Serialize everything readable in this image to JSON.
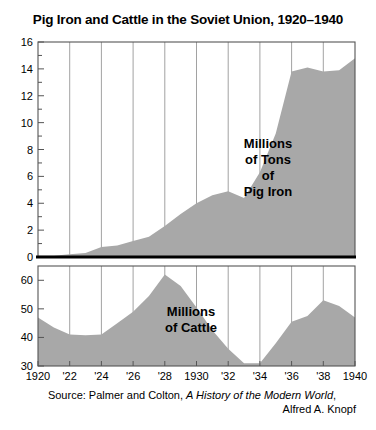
{
  "title": "Pig Iron and Cattle in the Soviet Union, 1920–1940",
  "source": {
    "line1_prefix": "Source: Palmer and Colton, ",
    "line1_italic": "A History of the Modern World",
    "line1_suffix": ",",
    "line2": "Alfred A. Knopf"
  },
  "labels": {
    "pig_iron": [
      "Millions",
      "of Tons",
      "of",
      "Pig Iron"
    ],
    "cattle": [
      "Millions",
      "of Cattle"
    ]
  },
  "colors": {
    "area_fill": "#a8a8a8",
    "axis": "#555555",
    "gridline": "#7a7a7a",
    "zero_line": "#000000",
    "background": "#ffffff",
    "text": "#000000"
  },
  "chart_data": [
    {
      "type": "area",
      "title": "Millions of Tons of Pig Iron",
      "panel": "top",
      "xlabel": "",
      "ylabel": "Millions of Tons of Pig Iron",
      "xlim": [
        1920,
        1940
      ],
      "ylim": [
        0,
        16
      ],
      "yticks": [
        0,
        2,
        4,
        6,
        8,
        10,
        12,
        14,
        16
      ],
      "ytick_labels": [
        "0",
        "2",
        "4",
        "6",
        "8",
        "10",
        "12",
        "14",
        "16"
      ],
      "xticks": [
        1920,
        1922,
        1924,
        1926,
        1928,
        1930,
        1932,
        1934,
        1936,
        1938,
        1940
      ],
      "xtick_labels": [
        "1920",
        "'22",
        "'24",
        "'26",
        "'28",
        "1930",
        "'32",
        "'34",
        "'36",
        "'38",
        "1940"
      ],
      "gridlines": [
        1922,
        1924,
        1926,
        1928,
        1930,
        1932,
        1934,
        1936,
        1938
      ],
      "grid": true,
      "legend": "none",
      "x": [
        1920,
        1921,
        1922,
        1923,
        1924,
        1925,
        1926,
        1927,
        1928,
        1929,
        1930,
        1931,
        1932,
        1933,
        1934,
        1935,
        1936,
        1937,
        1938,
        1939,
        1940
      ],
      "values": [
        0.1,
        0.1,
        0.2,
        0.3,
        0.75,
        0.85,
        1.2,
        1.5,
        2.3,
        3.2,
        4.0,
        4.6,
        4.9,
        4.4,
        6.3,
        9.2,
        13.8,
        14.1,
        13.8,
        13.9,
        14.8
      ]
    },
    {
      "type": "area",
      "title": "Millions of Cattle",
      "panel": "bottom",
      "xlabel": "",
      "ylabel": "Millions of Cattle",
      "xlim": [
        1920,
        1940
      ],
      "ylim": [
        30,
        65
      ],
      "yticks": [
        30,
        40,
        50,
        60
      ],
      "ytick_labels": [
        "30",
        "40",
        "50",
        "60"
      ],
      "xticks": [
        1920,
        1922,
        1924,
        1926,
        1928,
        1930,
        1932,
        1934,
        1936,
        1938,
        1940
      ],
      "xtick_labels": [
        "1920",
        "'22",
        "'24",
        "'26",
        "'28",
        "1930",
        "'32",
        "'34",
        "'36",
        "'38",
        "1940"
      ],
      "gridlines": [
        1922,
        1924,
        1926,
        1928,
        1930,
        1932,
        1934,
        1936,
        1938
      ],
      "grid": true,
      "legend": "none",
      "x": [
        1920,
        1921,
        1922,
        1923,
        1924,
        1925,
        1926,
        1927,
        1928,
        1929,
        1930,
        1931,
        1932,
        1933,
        1934,
        1935,
        1936,
        1937,
        1938,
        1939,
        1940
      ],
      "values": [
        47.0,
        43.5,
        41.0,
        40.8,
        41.0,
        45.0,
        49.0,
        54.5,
        62.0,
        58.0,
        50.5,
        42.5,
        36.0,
        31.0,
        31.0,
        38.0,
        45.5,
        47.5,
        53.0,
        51.0,
        47.0
      ]
    }
  ]
}
